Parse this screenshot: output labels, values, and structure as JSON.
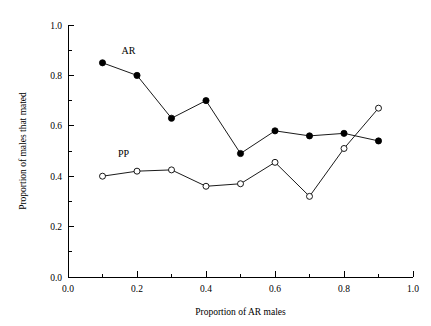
{
  "chart_data": {
    "type": "line",
    "title": "",
    "subtitle": "",
    "xlabel": "Proportion of AR males",
    "ylabel": "Proportion of males that mated",
    "xlim": [
      0.0,
      1.0
    ],
    "ylim": [
      0.0,
      1.0
    ],
    "grid": false,
    "legend_position": "inline-annotation",
    "x_ticks": [
      "0.0",
      "0.2",
      "0.4",
      "0.6",
      "0.8",
      "1.0"
    ],
    "x_tick_values": [
      0.0,
      0.2,
      0.4,
      0.6,
      0.8,
      1.0
    ],
    "x_minor_tick_values": [
      0.1,
      0.3,
      0.5,
      0.7,
      0.9
    ],
    "y_ticks": [
      "0.0",
      "0.2",
      "0.4",
      "0.6",
      "0.8",
      "1.0"
    ],
    "y_tick_values": [
      0.0,
      0.2,
      0.4,
      0.6,
      0.8,
      1.0
    ],
    "y_minor_tick_values": [
      0.1,
      0.3,
      0.5,
      0.7,
      0.9
    ],
    "x": [
      0.1,
      0.2,
      0.3,
      0.4,
      0.5,
      0.6,
      0.7,
      0.8,
      0.9
    ],
    "series": [
      {
        "name": "AR",
        "marker": "filled-circle",
        "color": "#000000",
        "label_x": 0.155,
        "label_y": 0.885,
        "values": [
          0.85,
          0.8,
          0.63,
          0.7,
          0.49,
          0.58,
          0.56,
          0.57,
          0.54
        ]
      },
      {
        "name": "PP",
        "marker": "open-circle",
        "color": "#000000",
        "label_x": 0.145,
        "label_y": 0.475,
        "values": [
          0.4,
          0.42,
          0.425,
          0.36,
          0.37,
          0.455,
          0.32,
          0.51,
          0.67
        ]
      }
    ]
  },
  "colors": {
    "background": "#ffffff",
    "axis": "#000000",
    "line": "#000000",
    "marker_fill_ar": "#000000",
    "marker_fill_pp": "#ffffff"
  }
}
